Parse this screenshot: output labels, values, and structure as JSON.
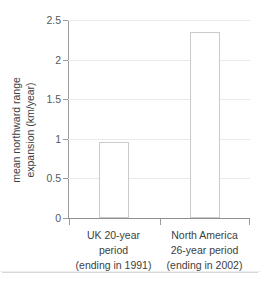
{
  "chart_data": {
    "type": "bar",
    "title": "",
    "subtitle": "",
    "xlabel": "",
    "ylabel": "mean northward range expansion (km/year)",
    "ylabel_line1": "mean northward range",
    "ylabel_line2": "expansion (km/year)",
    "categories": [
      "UK 20-year period (ending in 1991)",
      "North America 26-year period (ending in 2002)"
    ],
    "category_lines": [
      [
        "UK 20-year",
        "period",
        "(ending in 1991)"
      ],
      [
        "North America",
        "26-year period",
        "(ending in 2002)"
      ]
    ],
    "values": [
      0.96,
      2.35
    ],
    "ylim": [
      0,
      2.5
    ],
    "ytick_values": [
      0,
      0.5,
      1,
      1.5,
      2,
      2.5
    ],
    "ytick_labels": [
      "0",
      "0.5",
      "1",
      "1.5",
      "2",
      "2.5"
    ],
    "grid": true,
    "legend": false,
    "legend_position": "none",
    "bar_fill_color": "#ffffff",
    "bar_edge_color": "#c9cacc",
    "gridline_color": "#e9e9ea",
    "axis_color": "#9a9b9d",
    "text_color": "#3d3e40"
  },
  "figure": {
    "top_clipped_text": "",
    "background_color": "#ffffff"
  }
}
